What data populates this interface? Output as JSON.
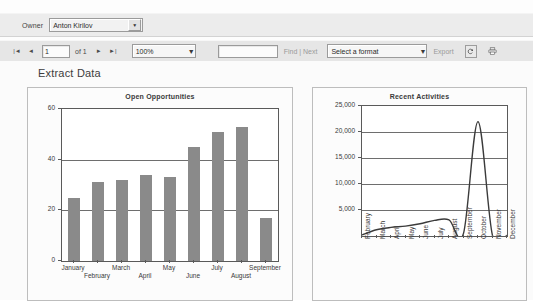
{
  "parameters": {
    "owner_label": "Owner",
    "owner_value": "Anton Kirilov",
    "dropdown_icon": "chevron-down-icon"
  },
  "toolbar": {
    "first_page_icon": "first-page-icon",
    "prev_page_icon": "previous-page-icon",
    "next_page_icon": "next-page-icon",
    "last_page_icon": "last-page-icon",
    "first_page_glyph": "|◄",
    "prev_page_glyph": "◄",
    "next_page_glyph": "►",
    "last_page_glyph": "►|",
    "page_number": "1",
    "of_text": "of 1",
    "zoom_value": "100%",
    "find_value": "",
    "find_label": "Find | Next",
    "format_value": "Select a format",
    "export_label": "Export",
    "refresh_icon": "refresh-icon",
    "print_icon": "print-icon"
  },
  "report": {
    "title": "Extract Data"
  },
  "chart_data": [
    {
      "type": "bar",
      "title": "Open Opportunities",
      "categories": [
        "January",
        "February",
        "March",
        "April",
        "May",
        "June",
        "July",
        "August",
        "September"
      ],
      "values": [
        25,
        31,
        32,
        34,
        33,
        45,
        51,
        53,
        17
      ],
      "xlabel": "",
      "ylabel": "",
      "ylim": [
        0,
        60
      ],
      "yticks": [
        "0",
        "20",
        "40",
        "60"
      ],
      "ytick_values": [
        0,
        20,
        40,
        60
      ],
      "grid": true,
      "legend": "none",
      "bar_color": "#8a8a8a"
    },
    {
      "type": "line",
      "title": "Recent Activities",
      "categories": [
        "February",
        "March",
        "April",
        "May",
        "June",
        "July",
        "August",
        "September",
        "October",
        "November",
        "December"
      ],
      "values": [
        200,
        1200,
        1650,
        1900,
        2350,
        3000,
        3100,
        500,
        22000,
        100,
        120
      ],
      "xlabel": "",
      "ylabel": "",
      "ylim": [
        0,
        25000
      ],
      "yticks": [
        "5,000",
        "10,000",
        "15,000",
        "20,000",
        "25,000"
      ],
      "ytick_values": [
        5000,
        10000,
        15000,
        20000,
        25000
      ],
      "grid": true,
      "legend": "none",
      "line_color": "#3b3b3b"
    }
  ]
}
